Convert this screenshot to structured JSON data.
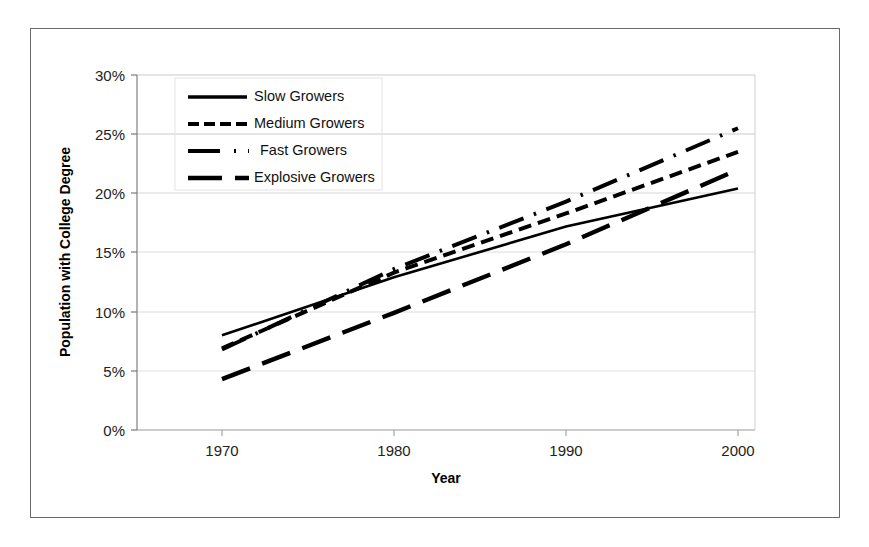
{
  "chart_data": {
    "type": "line",
    "title": "",
    "xlabel": "Year",
    "ylabel": "Population with College Degree",
    "x": [
      1970,
      1980,
      1990,
      2000
    ],
    "xlim": [
      1965,
      2005
    ],
    "ylim": [
      0,
      30
    ],
    "yticks": [
      0,
      5,
      10,
      15,
      20,
      25,
      30
    ],
    "ytick_labels": [
      "0%",
      "5%",
      "10%",
      "15%",
      "20%",
      "25%",
      "30%"
    ],
    "xtick_labels": [
      "1970",
      "1980",
      "1990",
      "2000"
    ],
    "grid": true,
    "grid_axis": "y",
    "legend_position": "upper left inside plot",
    "series": [
      {
        "name": "Slow Growers",
        "style": "solid",
        "color": "#000000",
        "values": [
          8.0,
          12.9,
          17.2,
          20.4
        ]
      },
      {
        "name": "Medium Growers",
        "style": "dashed",
        "color": "#000000",
        "values": [
          6.9,
          13.3,
          18.3,
          23.5
        ]
      },
      {
        "name": "Fast Growers",
        "style": "dash-dot",
        "color": "#000000",
        "values": [
          6.8,
          13.6,
          19.3,
          25.5
        ]
      },
      {
        "name": "Explosive Growers",
        "style": "long-dash",
        "color": "#000000",
        "values": [
          4.3,
          9.9,
          15.7,
          22.0
        ]
      }
    ]
  },
  "legend": {
    "entries": [
      {
        "label": "Slow Growers",
        "swatch": "solid-line-swatch"
      },
      {
        "label": "Medium Growers",
        "swatch": "dashed-line-swatch"
      },
      {
        "label": "Fast Growers",
        "swatch": "dash-dot-line-swatch"
      },
      {
        "label": "Explosive Growers",
        "swatch": "long-dash-line-swatch"
      }
    ]
  },
  "colors": {
    "series_line": "#000000",
    "grid": "#c9c9c9",
    "axis": "#7a7a7a",
    "frame": "#6b6b6b",
    "text": "#222222",
    "background": "#ffffff"
  }
}
